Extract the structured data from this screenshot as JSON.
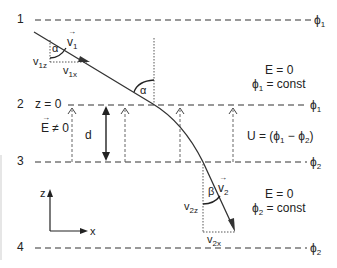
{
  "diagram": {
    "type": "charged-particle refraction between equipotential planes",
    "planes": [
      {
        "index": "1",
        "potential": "ϕ",
        "potential_sub": "1"
      },
      {
        "index": "2",
        "potential": "ϕ",
        "potential_sub": "1",
        "z_label": "z = 0"
      },
      {
        "index": "3",
        "potential": "ϕ",
        "potential_sub": "2"
      },
      {
        "index": "4",
        "potential": "ϕ",
        "potential_sub": "2"
      }
    ],
    "region_top": {
      "field": "E = 0",
      "potential_prefix": "ϕ",
      "potential_sub": "1",
      "potential_suffix": " = const"
    },
    "region_gap": {
      "field_label": "E",
      "field_suffix": " ≠ 0",
      "gap_label": "d",
      "voltage_prefix": "U = (ϕ",
      "voltage_sub1": "1",
      "voltage_mid": " − ϕ",
      "voltage_sub2": "2",
      "voltage_suffix": ")"
    },
    "region_bottom": {
      "field": "E = 0",
      "potential_prefix": "ϕ",
      "potential_sub": "2",
      "potential_suffix": " = const"
    },
    "incident": {
      "velocity": "v",
      "velocity_sub": "1",
      "comp_z": "v",
      "comp_z_sub": "1z",
      "comp_x": "v",
      "comp_x_sub": "1x",
      "angle": "α"
    },
    "refracted": {
      "velocity": "v",
      "velocity_sub": "2",
      "comp_z": "v",
      "comp_z_sub": "2z",
      "comp_x": "v",
      "comp_x_sub": "2x",
      "angle": "β"
    },
    "normal_angle": "α",
    "axes": {
      "vertical": "z",
      "horizontal": "x"
    },
    "vector_mark": "→"
  }
}
